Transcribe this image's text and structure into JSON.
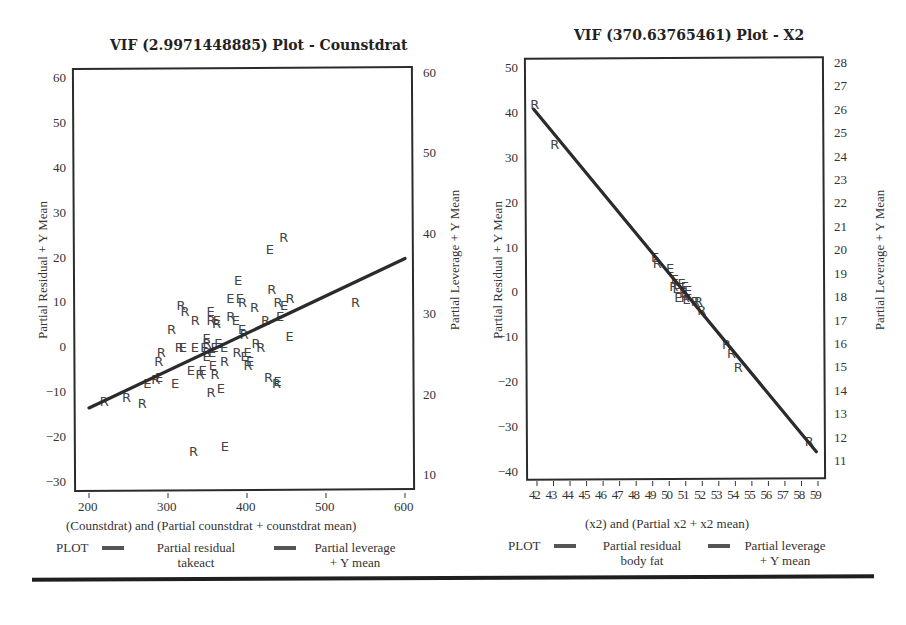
{
  "chart_data": [
    {
      "type": "scatter",
      "title": "VIF (2.9971448885) Plot - Counstdrat",
      "xlabel": "(Counstdrat) and (Partial counstdrat + counstdrat mean)",
      "ylabel": "Partial Residual + Y Mean",
      "ylabel_right": "Partial Leverage + Y Mean",
      "xlim": [
        190,
        610
      ],
      "ylim": [
        -31,
        62
      ],
      "ylim_right": [
        8,
        61
      ],
      "x_ticks": [
        200,
        300,
        400,
        500,
        600
      ],
      "y_ticks": [
        60,
        50,
        40,
        30,
        20,
        10,
        0,
        -10,
        -20,
        -30
      ],
      "y_ticks_right": [
        60,
        50,
        40,
        30,
        20,
        10
      ],
      "grid": false,
      "regression_line": {
        "x": [
          200,
          600
        ],
        "y": [
          -13.5,
          19.8
        ]
      },
      "series": [
        {
          "name": "Partial residual takeact",
          "marker": "R",
          "points": [
            [
              220,
              -12
            ],
            [
              248,
              -11
            ],
            [
              268,
              -12.5
            ],
            [
              285,
              -7
            ],
            [
              289,
              -3
            ],
            [
              292,
              -1
            ],
            [
              305,
              4
            ],
            [
              317,
              9.5
            ],
            [
              322,
              8
            ],
            [
              335,
              6
            ],
            [
              341,
              -6
            ],
            [
              350,
              1
            ],
            [
              355,
              -10
            ],
            [
              362,
              5.5
            ],
            [
              372,
              -3
            ],
            [
              380,
              7
            ],
            [
              395,
              10
            ],
            [
              402,
              -4
            ],
            [
              410,
              9
            ],
            [
              418,
              0
            ],
            [
              424,
              6
            ],
            [
              428,
              -6.5
            ],
            [
              432,
              13
            ],
            [
              438,
              -8
            ],
            [
              447,
              24.5
            ],
            [
              440,
              10
            ],
            [
              455,
              11
            ],
            [
              538,
              10
            ],
            [
              333,
              -23
            ],
            [
              315,
              0
            ],
            [
              350,
              -1
            ],
            [
              355,
              6
            ],
            [
              397,
              3
            ],
            [
              412,
              1
            ],
            [
              388,
              -1
            ],
            [
              360,
              -6
            ]
          ]
        },
        {
          "name": "Partial leverage + Y mean",
          "marker": "E",
          "points": [
            [
              275,
              -8
            ],
            [
              290,
              -6.5
            ],
            [
              310,
              -8
            ],
            [
              320,
              0
            ],
            [
              330,
              -5
            ],
            [
              335,
              0
            ],
            [
              345,
              -5
            ],
            [
              347,
              0
            ],
            [
              350,
              2
            ],
            [
              355,
              8
            ],
            [
              357,
              -1
            ],
            [
              358,
              -4
            ],
            [
              363,
              6
            ],
            [
              365,
              1
            ],
            [
              368,
              -9
            ],
            [
              372,
              0
            ],
            [
              373,
              -22
            ],
            [
              380,
              11
            ],
            [
              387,
              6
            ],
            [
              390,
              15
            ],
            [
              392,
              11
            ],
            [
              395,
              4
            ],
            [
              398,
              -2
            ],
            [
              402,
              -1
            ],
            [
              405,
              -3
            ],
            [
              430,
              22
            ],
            [
              440,
              -7.5
            ],
            [
              448,
              9.5
            ],
            [
              455,
              2.5
            ],
            [
              443,
              7
            ],
            [
              360,
              0
            ],
            [
              350,
              -2
            ]
          ]
        }
      ],
      "legend": {
        "label": "PLOT",
        "entries": [
          "Partial residual takeact",
          "Partial leverage + Y mean"
        ],
        "position": "bottom"
      }
    },
    {
      "type": "scatter",
      "title": "VIF (370.63765461) Plot - X2",
      "xlabel": "(x2) and (Partial x2 + x2 mean)",
      "ylabel": "Partial Residual + Y Mean",
      "ylabel_right": "Partial Leverage + Y Mean",
      "xlim": [
        41.3,
        59.5
      ],
      "ylim": [
        -42,
        53
      ],
      "ylim_right": [
        10.4,
        28.5
      ],
      "x_ticks": [
        42,
        43,
        44,
        45,
        46,
        47,
        48,
        49,
        50,
        51,
        52,
        53,
        54,
        55,
        56,
        57,
        58,
        59
      ],
      "y_ticks": [
        50,
        40,
        30,
        20,
        10,
        0,
        -10,
        -20,
        -30,
        -40
      ],
      "y_ticks_right": [
        28,
        27,
        26,
        25,
        24,
        23,
        22,
        21,
        20,
        19,
        18,
        17,
        16,
        15,
        14,
        13,
        12,
        11
      ],
      "grid": false,
      "regression_line": {
        "x": [
          41.8,
          58.9
        ],
        "y": [
          40.8,
          -35.5
        ]
      },
      "series": [
        {
          "name": "Partial residual body fat",
          "marker": "R",
          "points": [
            [
              41.9,
              42
            ],
            [
              43.1,
              33
            ],
            [
              49.3,
              6.5
            ],
            [
              50.3,
              1.5
            ],
            [
              51.0,
              -1
            ],
            [
              51.6,
              -2
            ],
            [
              52.0,
              -4
            ],
            [
              51.8,
              -2
            ],
            [
              53.5,
              -11.5
            ],
            [
              53.8,
              -13.5
            ],
            [
              54.2,
              -16.5
            ],
            [
              58.5,
              -33
            ]
          ]
        },
        {
          "name": "Partial leverage + Y mean",
          "marker": "E",
          "points": [
            [
              49.2,
              8
            ],
            [
              50.1,
              5.5
            ],
            [
              50.4,
              3
            ],
            [
              50.5,
              1
            ],
            [
              50.6,
              -1
            ],
            [
              50.8,
              2
            ],
            [
              50.9,
              0
            ],
            [
              51.0,
              1.5
            ],
            [
              51.1,
              -1.5
            ],
            [
              51.2,
              0.5
            ]
          ]
        }
      ],
      "legend": {
        "label": "PLOT",
        "entries": [
          "Partial residual body fat",
          "Partial leverage + Y mean"
        ],
        "position": "bottom"
      }
    }
  ],
  "left": {
    "title": "VIF (2.9971448885) Plot - Counstdrat",
    "ylabel": "Partial Residual + Y Mean",
    "ylabel_right": "Partial Leverage + Y Mean",
    "xlabel": "(Counstdrat) and (Partial counstdrat + counstdrat mean)",
    "legend": {
      "prefix": "PLOT",
      "item1_line1": "Partial residual",
      "item1_line2": "takeact",
      "item2_line1": "Partial leverage",
      "item2_line2": "+ Y mean"
    }
  },
  "right": {
    "title": "VIF (370.63765461) Plot - X2",
    "ylabel": "Partial Residual + Y Mean",
    "ylabel_right": "Partial Leverage + Y Mean",
    "xlabel": "(x2) and (Partial x2 + x2 mean)",
    "legend": {
      "prefix": "PLOT",
      "item1_line1": "Partial residual",
      "item1_line2": "body fat",
      "item2_line1": "Partial leverage",
      "item2_line2": "+ Y mean"
    }
  },
  "colors": {
    "line": "#2b2b2b",
    "marker": "#444444",
    "frame": "#2b2b2b"
  }
}
